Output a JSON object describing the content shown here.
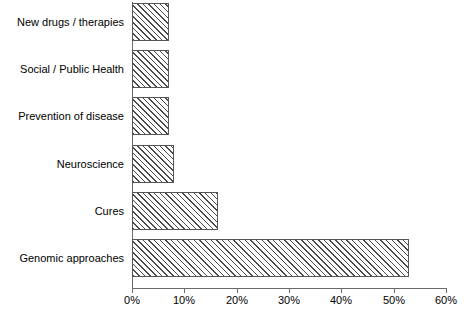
{
  "chart_data": {
    "type": "bar",
    "orientation": "horizontal",
    "title": "",
    "subtitle": "",
    "xlabel": "",
    "ylabel": "",
    "categories": [
      "New drugs / therapies",
      "Social / Public Health",
      "Prevention of disease",
      "Neuroscience",
      "Cures",
      "Genomic approaches"
    ],
    "values": [
      7,
      7,
      7,
      8,
      16.5,
      53
    ],
    "value_labels": [
      "7%",
      "7%",
      "7%",
      "8%",
      "16.5%",
      "53%"
    ],
    "xlim": [
      0,
      60
    ],
    "xtick_values": [
      0,
      10,
      20,
      30,
      40,
      50,
      60
    ],
    "xtick_labels": [
      "0%",
      "10%",
      "20%",
      "30%",
      "40%",
      "50%",
      "60%"
    ],
    "grid": false,
    "legend": false,
    "legend_position": "none",
    "series": [
      {
        "name": "Percent of responses",
        "values": [
          7,
          7,
          7,
          8,
          16.5,
          53
        ]
      }
    ],
    "bar_style": {
      "fill": "hatch-diagonal-45",
      "fill_color": "#ffffff",
      "hatch_color": "#4a4a4a",
      "edge_color": "#555555"
    },
    "axis_color": "#6b6b6b",
    "text_color": "#000000",
    "background": "#ffffff"
  },
  "axis": {
    "x_ticks": [
      {
        "label": "0%",
        "value": 0
      },
      {
        "label": "10%",
        "value": 10
      },
      {
        "label": "20%",
        "value": 20
      },
      {
        "label": "30%",
        "value": 30
      },
      {
        "label": "40%",
        "value": 40
      },
      {
        "label": "50%",
        "value": 50
      },
      {
        "label": "60%",
        "value": 60
      }
    ]
  },
  "categories": [
    {
      "label": "New drugs / therapies"
    },
    {
      "label": "Social / Public Health"
    },
    {
      "label": "Prevention of disease"
    },
    {
      "label": "Neuroscience"
    },
    {
      "label": "Cures"
    },
    {
      "label": "Genomic approaches"
    }
  ]
}
